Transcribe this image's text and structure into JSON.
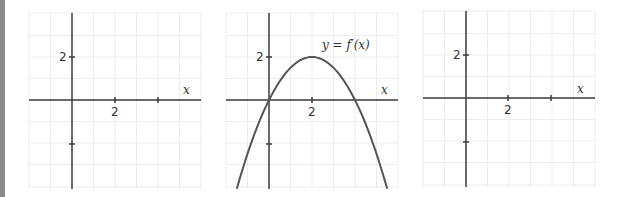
{
  "chart_data": [
    {
      "type": "line",
      "panel": "left",
      "title": "",
      "xlabel": "x",
      "ylabel": "",
      "x_ticks": [
        {
          "value": 2,
          "label": "2"
        },
        {
          "value": 4,
          "label": ""
        }
      ],
      "y_ticks": [
        {
          "value": 2,
          "label": "2"
        },
        {
          "value": -2,
          "label": ""
        }
      ],
      "xlim": [
        -2,
        6
      ],
      "ylim": [
        -4,
        4
      ],
      "grid": true,
      "series": []
    },
    {
      "type": "line",
      "panel": "middle",
      "title": "",
      "xlabel": "x",
      "ylabel": "",
      "x_ticks": [
        {
          "value": 2,
          "label": "2"
        },
        {
          "value": 4,
          "label": ""
        }
      ],
      "y_ticks": [
        {
          "value": 2,
          "label": "2"
        },
        {
          "value": -2,
          "label": ""
        }
      ],
      "xlim": [
        -2,
        6
      ],
      "ylim": [
        -4,
        4
      ],
      "grid": true,
      "annotation": "y = f′(x)",
      "series": [
        {
          "name": "y = f′(x)",
          "x": [
            -1.5,
            -1,
            0,
            1,
            2,
            3,
            4,
            5,
            5.5
          ],
          "y": [
            -4.125,
            -2.5,
            0,
            1.5,
            2,
            1.5,
            0,
            -2.5,
            -4.125
          ]
        }
      ]
    },
    {
      "type": "line",
      "panel": "right",
      "title": "",
      "xlabel": "x",
      "ylabel": "",
      "x_ticks": [
        {
          "value": 2,
          "label": "2"
        },
        {
          "value": 4,
          "label": ""
        }
      ],
      "y_ticks": [
        {
          "value": 2,
          "label": "2"
        },
        {
          "value": -2,
          "label": ""
        }
      ],
      "xlim": [
        -2,
        6
      ],
      "ylim": [
        -4,
        4
      ],
      "grid": true,
      "series": []
    }
  ],
  "labels": {
    "x_axis": "x",
    "tick_two": "2",
    "curve_annotation": "y = f′(x)"
  }
}
